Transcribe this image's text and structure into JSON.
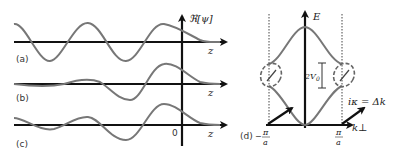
{
  "figure": {
    "panels": [
      {
        "id": "a",
        "label": "(a)",
        "axis_label": "z"
      },
      {
        "id": "b",
        "label": "(b)",
        "axis_label": "z"
      },
      {
        "id": "c",
        "label": "(c)",
        "axis_label": "z",
        "origin_label": "0"
      },
      {
        "id": "d",
        "label": "(d)"
      }
    ],
    "y_axis_label": "ℜ[ψ]",
    "band": {
      "y_axis_label": "E",
      "x_axis_label": "k⊥",
      "gap_label": "2V",
      "gap_sub": "0",
      "left_tick_num": "π",
      "left_tick_den": "a",
      "left_tick_sign": "−",
      "right_tick_num": "π",
      "right_tick_den": "a",
      "arrow_label": "iκ = Δk"
    }
  }
}
